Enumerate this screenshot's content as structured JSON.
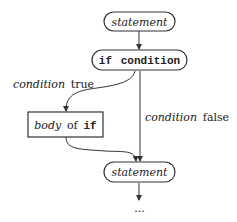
{
  "diagram": {
    "type": "flowchart",
    "nodes": [
      {
        "id": "stmt_top",
        "shape": "rounded",
        "label": "statement",
        "style": "italic"
      },
      {
        "id": "if_cond",
        "shape": "rounded",
        "label_keyword": "if",
        "label_text": "condition",
        "style": "monospace"
      },
      {
        "id": "body",
        "shape": "rectangle",
        "label_prefix": "body",
        "label_middle": "of",
        "label_keyword": "if"
      },
      {
        "id": "stmt_bottom",
        "shape": "rounded",
        "label": "statement",
        "style": "italic"
      },
      {
        "id": "continuation",
        "shape": "none",
        "label": "..."
      }
    ],
    "edges": [
      {
        "from": "stmt_top",
        "to": "if_cond",
        "label": ""
      },
      {
        "from": "if_cond",
        "to": "body",
        "label_italic": "condition",
        "label_plain": "true"
      },
      {
        "from": "if_cond",
        "to": "stmt_bottom",
        "label_italic": "condition",
        "label_plain": "false"
      },
      {
        "from": "body",
        "to": "stmt_bottom",
        "label": ""
      },
      {
        "from": "stmt_bottom",
        "to": "continuation",
        "label": ""
      }
    ],
    "colors": {
      "stroke": "#333333",
      "text": "#222222",
      "background": "#ffffff"
    }
  }
}
